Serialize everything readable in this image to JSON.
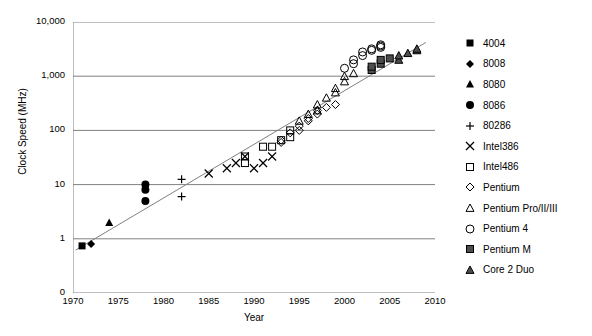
{
  "chart_data": {
    "type": "scatter",
    "title": "",
    "xlabel": "Year",
    "ylabel": "Clock Speed (MHz)",
    "xlim": [
      1970,
      2010
    ],
    "ylim": [
      0.3,
      10000
    ],
    "yscale": "log",
    "grid": true,
    "legend_position": "right",
    "x_ticks": [
      "1970",
      "1975",
      "1980",
      "1985",
      "1990",
      "1995",
      "2000",
      "2005",
      "2010"
    ],
    "x_tick_values": [
      1970,
      1975,
      1980,
      1985,
      1990,
      1995,
      2000,
      2005,
      2010
    ],
    "y_ticks": [
      "0",
      "1",
      "10",
      "100",
      "1,000",
      "10,000"
    ],
    "y_tick_values": [
      0,
      1,
      10,
      100,
      1000,
      10000
    ],
    "trendline": {
      "label": "trend-line",
      "x": [
        1970.3,
        2009.0
      ],
      "y": [
        0.62,
        4200
      ]
    },
    "series": [
      {
        "name": "4004",
        "marker": "filled-square",
        "points": [
          {
            "x": 1971,
            "y": 0.74
          }
        ]
      },
      {
        "name": "8008",
        "marker": "filled-diamond",
        "points": [
          {
            "x": 1972,
            "y": 0.8
          }
        ]
      },
      {
        "name": "8080",
        "marker": "filled-triangle",
        "points": [
          {
            "x": 1974,
            "y": 2.0
          }
        ]
      },
      {
        "name": "8086",
        "marker": "filled-circle",
        "points": [
          {
            "x": 1978,
            "y": 5.0
          },
          {
            "x": 1978,
            "y": 8.0
          },
          {
            "x": 1978,
            "y": 10.0
          }
        ]
      },
      {
        "name": "80286",
        "marker": "plus",
        "points": [
          {
            "x": 1982,
            "y": 6.0
          },
          {
            "x": 1982,
            "y": 12.5
          }
        ]
      },
      {
        "name": "Intel386",
        "marker": "cross",
        "points": [
          {
            "x": 1985,
            "y": 16
          },
          {
            "x": 1987,
            "y": 20
          },
          {
            "x": 1988,
            "y": 25
          },
          {
            "x": 1989,
            "y": 33
          },
          {
            "x": 1990,
            "y": 20
          },
          {
            "x": 1991,
            "y": 25
          },
          {
            "x": 1992,
            "y": 33
          }
        ]
      },
      {
        "name": "Intel486",
        "marker": "open-square",
        "points": [
          {
            "x": 1989,
            "y": 25
          },
          {
            "x": 1989,
            "y": 33
          },
          {
            "x": 1991,
            "y": 50
          },
          {
            "x": 1992,
            "y": 50
          },
          {
            "x": 1993,
            "y": 66
          },
          {
            "x": 1994,
            "y": 75
          },
          {
            "x": 1994,
            "y": 100
          }
        ]
      },
      {
        "name": "Pentium",
        "marker": "open-diamond",
        "points": [
          {
            "x": 1993,
            "y": 60
          },
          {
            "x": 1993,
            "y": 66
          },
          {
            "x": 1994,
            "y": 90
          },
          {
            "x": 1995,
            "y": 100
          },
          {
            "x": 1995,
            "y": 120
          },
          {
            "x": 1996,
            "y": 150
          },
          {
            "x": 1996,
            "y": 166
          },
          {
            "x": 1997,
            "y": 200
          },
          {
            "x": 1997,
            "y": 233
          },
          {
            "x": 1998,
            "y": 266
          },
          {
            "x": 1999,
            "y": 300
          }
        ]
      },
      {
        "name": "Pentium Pro/II/III",
        "marker": "open-triangle",
        "points": [
          {
            "x": 1995,
            "y": 150
          },
          {
            "x": 1996,
            "y": 200
          },
          {
            "x": 1997,
            "y": 233
          },
          {
            "x": 1997,
            "y": 300
          },
          {
            "x": 1998,
            "y": 400
          },
          {
            "x": 1999,
            "y": 500
          },
          {
            "x": 1999,
            "y": 600
          },
          {
            "x": 2000,
            "y": 800
          },
          {
            "x": 2000,
            "y": 1000
          },
          {
            "x": 2001,
            "y": 1130
          }
        ]
      },
      {
        "name": "Pentium 4",
        "marker": "open-circle",
        "points": [
          {
            "x": 2000,
            "y": 1400
          },
          {
            "x": 2001,
            "y": 1700
          },
          {
            "x": 2001,
            "y": 2000
          },
          {
            "x": 2002,
            "y": 2400
          },
          {
            "x": 2002,
            "y": 2800
          },
          {
            "x": 2003,
            "y": 3000
          },
          {
            "x": 2003,
            "y": 3200
          },
          {
            "x": 2004,
            "y": 3400
          },
          {
            "x": 2004,
            "y": 3600
          },
          {
            "x": 2004,
            "y": 3800
          }
        ]
      },
      {
        "name": "Pentium M",
        "marker": "filled-square-gray",
        "points": [
          {
            "x": 2003,
            "y": 1300
          },
          {
            "x": 2003,
            "y": 1500
          },
          {
            "x": 2004,
            "y": 1700
          },
          {
            "x": 2004,
            "y": 2000
          },
          {
            "x": 2005,
            "y": 2130
          }
        ]
      },
      {
        "name": "Core 2 Duo",
        "marker": "filled-triangle-dark",
        "points": [
          {
            "x": 2006,
            "y": 2000
          },
          {
            "x": 2006,
            "y": 2400
          },
          {
            "x": 2007,
            "y": 2660
          },
          {
            "x": 2008,
            "y": 3000
          },
          {
            "x": 2008,
            "y": 3200
          }
        ]
      }
    ]
  },
  "axis": {
    "y_title": "Clock Speed (MHz)",
    "x_title": "Year"
  },
  "legend": {
    "items": [
      {
        "label": "4004",
        "marker": "filled-square"
      },
      {
        "label": "8008",
        "marker": "filled-diamond"
      },
      {
        "label": "8080",
        "marker": "filled-triangle"
      },
      {
        "label": "8086",
        "marker": "filled-circle"
      },
      {
        "label": "80286",
        "marker": "plus"
      },
      {
        "label": "Intel386",
        "marker": "cross"
      },
      {
        "label": "Intel486",
        "marker": "open-square"
      },
      {
        "label": "Pentium",
        "marker": "open-diamond"
      },
      {
        "label": "Pentium Pro/II/III",
        "marker": "open-triangle"
      },
      {
        "label": "Pentium 4",
        "marker": "open-circle"
      },
      {
        "label": "Pentium M",
        "marker": "filled-square-gray"
      },
      {
        "label": "Core 2 Duo",
        "marker": "filled-triangle-dark"
      }
    ]
  },
  "colors": {
    "axis": "#000000",
    "grid": "#808080",
    "marker": "#000000",
    "marker_gray": "#4d4d4d",
    "trendline": "#808080",
    "background": "#ffffff"
  }
}
